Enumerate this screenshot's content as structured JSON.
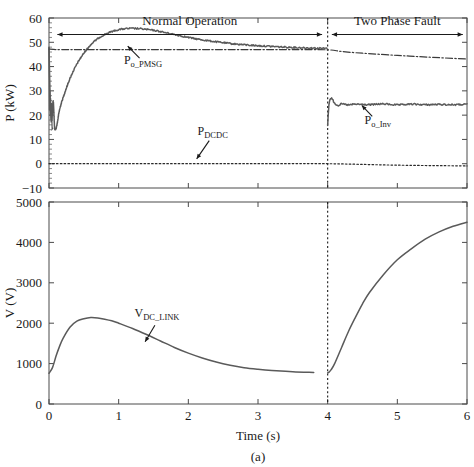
{
  "figure": {
    "caption": "(a)",
    "xlabel": "Time (s)"
  },
  "chart_data": [
    {
      "type": "line",
      "panel": "top",
      "title": "",
      "xlabel": "Time (s)",
      "ylabel": "P (kW)",
      "xlim": [
        0,
        6
      ],
      "ylim": [
        -10,
        60
      ],
      "xticks": [
        0,
        1,
        2,
        3,
        4,
        5,
        6
      ],
      "yticks": [
        -10,
        0,
        10,
        20,
        30,
        40,
        50,
        60
      ],
      "grid": false,
      "legend": "annotations",
      "annotations": [
        {
          "label": "P",
          "sub": "o_PMSG",
          "x": 1.35,
          "y": 41.0
        },
        {
          "label": "P",
          "sub": "DCDC",
          "x": 2.35,
          "y": 12.0
        },
        {
          "label": "P",
          "sub": "o_Inv",
          "x": 4.72,
          "y": 16.5
        }
      ],
      "phase_markers": [
        {
          "label": "Normal Operation",
          "x_start": 0.12,
          "x_end": 3.92
        },
        {
          "label": "Two Phase Fault",
          "x_start": 4.06,
          "x_end": 5.94
        }
      ],
      "fault_time": 4.0,
      "series": [
        {
          "name": "P_o_PMSG",
          "style": "solid",
          "color": "#5a5a5a",
          "x": [
            0.0,
            0.02,
            0.04,
            0.06,
            0.08,
            0.1,
            0.12,
            0.15,
            0.2,
            0.3,
            0.4,
            0.5,
            0.6,
            0.7,
            0.8,
            0.9,
            1.0,
            1.1,
            1.2,
            1.3,
            1.4,
            1.5,
            1.6,
            1.8,
            2.0,
            2.2,
            2.4,
            2.6,
            2.8,
            3.0,
            3.2,
            3.4,
            3.6,
            3.8,
            3.99,
            4.0,
            4.02,
            4.05,
            4.1,
            4.15,
            4.2,
            4.3,
            4.4,
            4.6,
            4.8,
            5.0,
            5.2,
            5.4,
            5.6,
            5.8,
            6.0
          ],
          "y": [
            48.0,
            24.0,
            18.0,
            26.0,
            15.0,
            14.5,
            17.0,
            22.0,
            27.0,
            35.0,
            41.0,
            45.5,
            49.0,
            51.5,
            53.2,
            54.4,
            55.2,
            55.6,
            55.7,
            55.6,
            55.3,
            54.9,
            54.4,
            53.2,
            52.0,
            51.0,
            50.2,
            49.5,
            49.0,
            48.6,
            48.3,
            48.0,
            47.8,
            47.6,
            47.5,
            16.0,
            24.5,
            27.0,
            25.0,
            24.0,
            24.6,
            24.2,
            24.5,
            24.3,
            24.6,
            24.2,
            24.5,
            24.3,
            24.4,
            24.3,
            24.4
          ]
        },
        {
          "name": "P_o_Inv",
          "style": "dashdot",
          "color": "#3a3a3a",
          "x": [
            0.0,
            0.1,
            0.3,
            0.6,
            1.0,
            1.5,
            2.0,
            2.5,
            3.0,
            3.5,
            4.0,
            4.2,
            4.5,
            5.0,
            5.5,
            6.0
          ],
          "y": [
            47.2,
            47.0,
            47.0,
            47.0,
            47.0,
            47.0,
            47.0,
            47.0,
            47.0,
            47.0,
            46.9,
            46.2,
            45.5,
            44.6,
            43.8,
            43.1
          ]
        },
        {
          "name": "P_DCDC",
          "style": "dotted",
          "color": "#2a2a2a",
          "x": [
            0.0,
            1.0,
            2.0,
            3.0,
            4.0,
            5.0,
            6.0
          ],
          "y": [
            0.0,
            0.0,
            0.0,
            0.0,
            0.0,
            -0.6,
            -0.9
          ]
        }
      ]
    },
    {
      "type": "line",
      "panel": "bottom",
      "title": "",
      "xlabel": "Time (s)",
      "ylabel": "V (V)",
      "xlim": [
        0,
        6
      ],
      "ylim": [
        0,
        5000
      ],
      "xticks": [
        0,
        1,
        2,
        3,
        4,
        5,
        6
      ],
      "yticks": [
        0,
        1000,
        2000,
        3000,
        4000,
        5000
      ],
      "grid": false,
      "annotations": [
        {
          "label": "V",
          "sub": "DC_LINK",
          "x": 1.55,
          "y": 2150
        }
      ],
      "fault_time": 4.0,
      "series": [
        {
          "name": "V_DC_LINK",
          "style": "solid",
          "color": "#5a5a5a",
          "x": [
            0.0,
            0.05,
            0.1,
            0.15,
            0.2,
            0.3,
            0.4,
            0.5,
            0.6,
            0.7,
            0.8,
            0.9,
            1.0,
            1.2,
            1.4,
            1.6,
            1.8,
            2.0,
            2.2,
            2.4,
            2.6,
            2.8,
            3.0,
            3.2,
            3.5,
            3.8,
            4.0,
            4.02,
            4.05,
            4.1,
            4.2,
            4.3,
            4.4,
            4.5,
            4.6,
            4.8,
            5.0,
            5.2,
            5.4,
            5.6,
            5.8,
            6.0
          ],
          "y": [
            760,
            900,
            1180,
            1420,
            1620,
            1900,
            2050,
            2110,
            2140,
            2130,
            2100,
            2060,
            2000,
            1870,
            1720,
            1560,
            1400,
            1260,
            1140,
            1040,
            960,
            900,
            860,
            830,
            800,
            780,
            770,
            790,
            850,
            1000,
            1400,
            1800,
            2150,
            2480,
            2760,
            3200,
            3570,
            3840,
            4080,
            4260,
            4400,
            4500
          ]
        }
      ]
    }
  ]
}
